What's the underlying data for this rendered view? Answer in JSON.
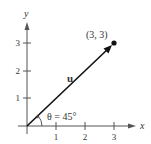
{
  "diagram": {
    "type": "vector-plot",
    "axes": {
      "x_label": "x",
      "y_label": "y",
      "x_ticks": [
        "1",
        "2",
        "3"
      ],
      "y_ticks": [
        "1",
        "2",
        "3"
      ]
    },
    "vector": {
      "label": "u",
      "from": [
        0,
        0
      ],
      "to": [
        3,
        3
      ]
    },
    "point": {
      "label": "(3, 3)"
    },
    "angle": {
      "label": "θ = 45°",
      "degrees": 45
    },
    "colors": {
      "axis": "#555555",
      "vector": "#111111",
      "text": "#333333",
      "background": "#ffffff"
    }
  }
}
